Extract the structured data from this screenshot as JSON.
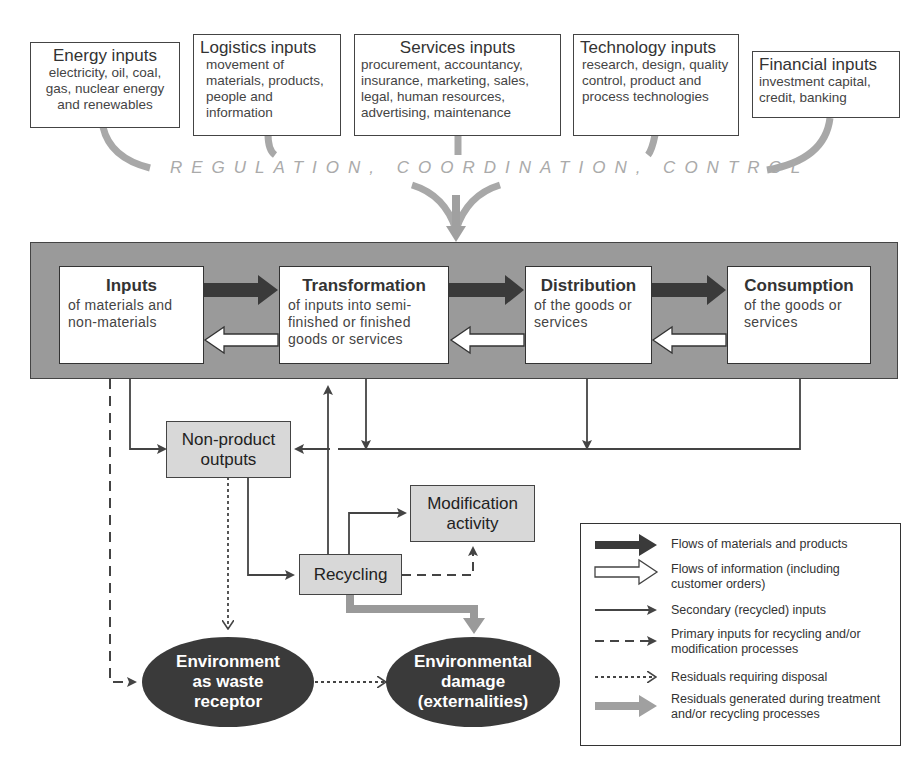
{
  "top_inputs": [
    {
      "title": "Energy inputs",
      "desc": "electricity, oil, coal, gas, nuclear energy and renewables"
    },
    {
      "title": "Logistics inputs",
      "desc": "movement of materials, products, people and information"
    },
    {
      "title": "Services inputs",
      "desc": "procurement, accountancy, insurance, marketing, sales, legal, human resources, advertising, maintenance"
    },
    {
      "title": "Technology inputs",
      "desc": "research, design, quality control, product and process technologies"
    },
    {
      "title": "Financial inputs",
      "desc": "investment capital, credit, banking"
    }
  ],
  "regulation_label": "REGULATION, COORDINATION, CONTROL",
  "stages": [
    {
      "title": "Inputs",
      "desc": "of materials and non-materials"
    },
    {
      "title": "Transformation",
      "desc": "of inputs into semi-finished or finished goods or services"
    },
    {
      "title": "Distribution",
      "desc": "of the goods or services"
    },
    {
      "title": "Consumption",
      "desc": "of the goods or services"
    }
  ],
  "nodes": {
    "non_product_outputs": "Non-product outputs",
    "modification_activity": "Modification activity",
    "recycling": "Recycling",
    "environment_waste": "Environment as waste receptor",
    "environmental_damage": "Environmental damage (externalities)"
  },
  "legend": [
    {
      "icon": "thick-dark-arrow",
      "label": "Flows of materials and products"
    },
    {
      "icon": "hollow-arrow",
      "label": "Flows of information (including customer orders)"
    },
    {
      "icon": "thin-solid-arrow",
      "label": "Secondary (recycled) inputs"
    },
    {
      "icon": "dashed-arrow",
      "label": "Primary inputs for recycling and/or modification processes"
    },
    {
      "icon": "dotted-arrow",
      "label": "Residuals requiring disposal"
    },
    {
      "icon": "thick-gray-arrow",
      "label": "Residuals generated during treatment and/or recycling processes"
    }
  ],
  "colors": {
    "dark_flow": "#3a3a3a",
    "gray_flow": "#a0a0a0",
    "panel": "#9a9a9a",
    "node_fill": "#d8d8d8",
    "ellipse_fill": "#3a3a3a"
  }
}
